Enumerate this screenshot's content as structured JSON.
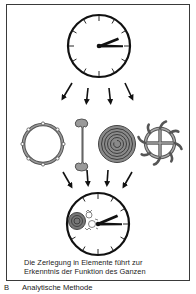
{
  "figure": {
    "panel_letter": "B",
    "panel_title": "Analytische Methode",
    "caption_lines": [
      "Die Zerlegung in Elemente führt zur",
      "Erkenntnis der Funktion des Ganzen"
    ],
    "top": {
      "element": "clock",
      "state": "whole",
      "time_shown": "approx. 2:15"
    },
    "arrows_out": 4,
    "components": [
      {
        "name": "ring",
        "description": "toothed ring / gear rim"
      },
      {
        "name": "wrench",
        "description": "double-ended wrench-shaped part"
      },
      {
        "name": "spiral",
        "description": "coiled spring"
      },
      {
        "name": "sun-wheel",
        "description": "spoked wheel with curved teeth"
      }
    ],
    "arrows_in": 4,
    "bottom": {
      "element": "clock",
      "state": "with inner mechanism revealed"
    },
    "colors": {
      "ink": "#111111",
      "gray_fill": "#8a8a8a",
      "frame": "#3a3a3a",
      "background": "#ffffff"
    }
  }
}
